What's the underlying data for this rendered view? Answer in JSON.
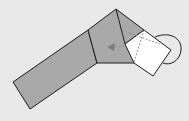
{
  "diagram": {
    "type": "origami-fold-step",
    "colors": {
      "background": "#e9e9e9",
      "paper_colored_side": "#a9a9a9",
      "paper_white_side": "#ffffff",
      "line": "#1e1e1e",
      "arrow": "#8a8a8a"
    },
    "elements": [
      {
        "name": "long-strip",
        "fill": "colored"
      },
      {
        "name": "middle-panel",
        "fill": "colored"
      },
      {
        "name": "top-triangle-flap",
        "fill": "colored"
      },
      {
        "name": "white-square-flap",
        "fill": "white"
      },
      {
        "name": "valley-fold-lines",
        "style": "dashed"
      },
      {
        "name": "fold-direction-arrow",
        "direction": "left"
      },
      {
        "name": "loop-arrow",
        "style": "arc"
      }
    ]
  }
}
